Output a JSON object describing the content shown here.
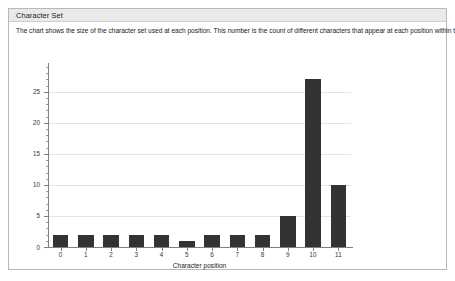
{
  "panel": {
    "title": "Character Set",
    "description": "The chart shows the size of the character set used at each position. This number is the count of different characters that appear at each position within the sample data."
  },
  "colors": {
    "bar": "#333333",
    "gridline": "#e4e4e4",
    "axis": "#808080",
    "header_background": "#e9e9e9",
    "panel_border": "#b9b9b9"
  },
  "chart_data": {
    "type": "bar",
    "title": "",
    "xlabel": "Character position",
    "ylabel": "",
    "categories": [
      "0",
      "1",
      "2",
      "3",
      "4",
      "5",
      "6",
      "7",
      "8",
      "9",
      "10",
      "11"
    ],
    "values": [
      2,
      2,
      2,
      2,
      2,
      1,
      2,
      2,
      2,
      5,
      27,
      10
    ],
    "ylim": [
      0,
      29
    ],
    "yticks": [
      0,
      5,
      10,
      15,
      20,
      25
    ],
    "ytick_labels": [
      "0",
      "5",
      "10",
      "15",
      "20",
      "25"
    ],
    "grid": true,
    "legend": false
  }
}
